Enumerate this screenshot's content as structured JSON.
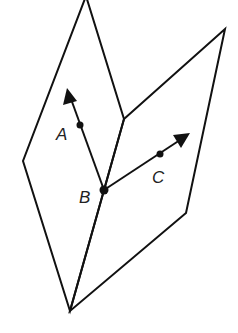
{
  "figure": {
    "colors": {
      "stroke": "#111111",
      "label": "#222222",
      "background": "#ffffff"
    },
    "left_plane": {
      "vertices": [
        [
          86,
          -4
        ],
        [
          124,
          119
        ],
        [
          70,
          311
        ],
        [
          23,
          161
        ]
      ]
    },
    "right_plane": {
      "vertices": [
        [
          124,
          119
        ],
        [
          225,
          29
        ],
        [
          186,
          213
        ],
        [
          70,
          311
        ]
      ]
    },
    "common_edge": [
      [
        124,
        119
      ],
      [
        70,
        311
      ]
    ],
    "points": [
      {
        "name": "A",
        "label": "A",
        "x": 80,
        "y": 125,
        "label_x": 56,
        "label_y": 140
      },
      {
        "name": "B",
        "label": "B",
        "x": 104,
        "y": 190,
        "label_x": 79,
        "label_y": 203
      },
      {
        "name": "C",
        "label": "C",
        "x": 160,
        "y": 154,
        "label_x": 152,
        "label_y": 183
      }
    ],
    "rays": [
      {
        "name": "ray-BA",
        "from": [
          104,
          190
        ],
        "to": [
          67,
          88
        ]
      },
      {
        "name": "ray-BC",
        "from": [
          104,
          190
        ],
        "to": [
          190,
          133
        ]
      }
    ]
  }
}
